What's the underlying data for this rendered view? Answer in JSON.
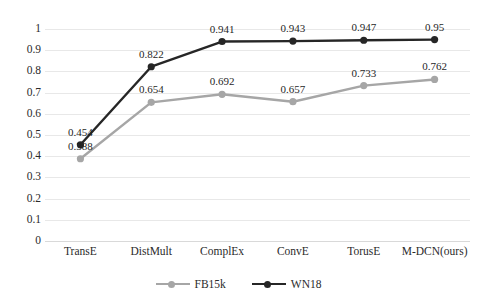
{
  "chart_data": {
    "type": "line",
    "title": "",
    "subtitle": "",
    "xlabel": "",
    "ylabel": "",
    "categories": [
      "TransE",
      "DistMult",
      "ComplEx",
      "ConvE",
      "TorusE",
      "M-DCN(ours)"
    ],
    "series": [
      {
        "name": "FB15k",
        "color": "#a6a6a6",
        "values": [
          0.388,
          0.654,
          0.692,
          0.657,
          0.733,
          0.762
        ],
        "labels": [
          "0.388",
          "0.654",
          "0.692",
          "0.657",
          "0.733",
          "0.762"
        ]
      },
      {
        "name": "WN18",
        "color": "#262626",
        "values": [
          0.454,
          0.822,
          0.941,
          0.943,
          0.947,
          0.95
        ],
        "labels": [
          "0.454",
          "0.822",
          "0.941",
          "0.943",
          "0.947",
          "0.95"
        ]
      }
    ],
    "ylim": [
      0,
      1
    ],
    "ytick_labels": [
      "1",
      "0.9",
      "0.8",
      "0.7",
      "0.6",
      "0.5",
      "0.4",
      "0.3",
      "0.2",
      "0.1",
      "0"
    ],
    "ytick_values": [
      1,
      0.9,
      0.8,
      0.7,
      0.6,
      0.5,
      0.4,
      0.3,
      0.2,
      0.1,
      0
    ],
    "grid": true,
    "grid_color": "#e8e8e8",
    "legend_position": "bottom-center",
    "background": "#ffffff"
  }
}
